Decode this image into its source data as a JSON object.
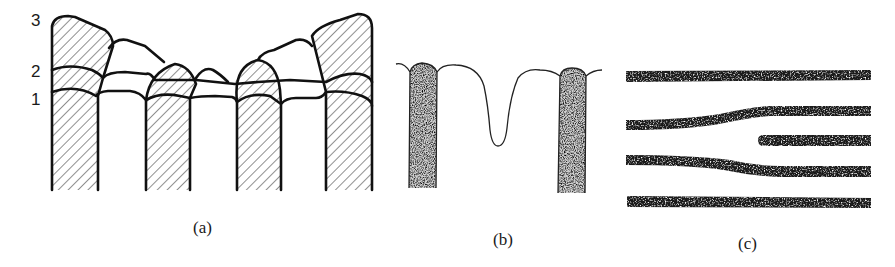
{
  "figure": {
    "panels": [
      {
        "id": "a",
        "caption": "(a)",
        "layer_labels": [
          "3",
          "2",
          "1"
        ],
        "description": "Hatched grain columns with successive growth-front layers 1, 2, 3"
      },
      {
        "id": "b",
        "caption": "(b)",
        "description": "Two stippled columns with a free surface dipping into a groove between them"
      },
      {
        "id": "c",
        "caption": "(c)",
        "description": "Five horizontal stippled lamellae, one terminating and the neighbours bending to fill the gap"
      }
    ],
    "colors": {
      "line": "#111111",
      "background": "#ffffff"
    }
  }
}
